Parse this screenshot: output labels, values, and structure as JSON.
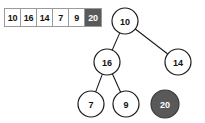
{
  "array": {
    "name": "heap-array",
    "cells": [
      {
        "value": "10",
        "highlighted": false
      },
      {
        "value": "16",
        "highlighted": false
      },
      {
        "value": "14",
        "highlighted": false
      },
      {
        "value": "7",
        "highlighted": false
      },
      {
        "value": "9",
        "highlighted": false
      },
      {
        "value": "20",
        "highlighted": true
      }
    ]
  },
  "tree": {
    "name": "heap-tree",
    "nodes": [
      {
        "id": "root",
        "label": "10",
        "cx": 125,
        "cy": 21,
        "r": 13,
        "filled": false
      },
      {
        "id": "left",
        "label": "16",
        "cx": 107,
        "cy": 62,
        "r": 13,
        "filled": false
      },
      {
        "id": "right",
        "label": "14",
        "cx": 178,
        "cy": 62,
        "r": 13,
        "filled": false
      },
      {
        "id": "leaf-7",
        "label": "7",
        "cx": 91,
        "cy": 104,
        "r": 13,
        "filled": false
      },
      {
        "id": "leaf-9",
        "label": "9",
        "cx": 126,
        "cy": 104,
        "r": 13,
        "filled": false
      },
      {
        "id": "new-20",
        "label": "20",
        "cx": 165,
        "cy": 104,
        "r": 14,
        "filled": true
      }
    ],
    "edges": [
      {
        "from": "root",
        "to": "left"
      },
      {
        "from": "root",
        "to": "right"
      },
      {
        "from": "left",
        "to": "leaf-7"
      },
      {
        "from": "left",
        "to": "leaf-9"
      }
    ]
  },
  "colors": {
    "highlight_fill": "#595959",
    "highlight_text": "#ffffff",
    "node_stroke": "#1a1a1a",
    "cell_border": "#9a9a9a",
    "background": "#ffffff"
  }
}
